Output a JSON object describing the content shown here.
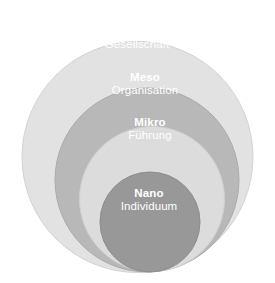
{
  "chart_data": {
    "type": "diagram",
    "subtype": "nested-concentric-circles",
    "title": "",
    "background_color": "#ffffff",
    "canvas": {
      "width": 275,
      "height": 283
    },
    "label_text_color": "#ffffff",
    "levels": [
      {
        "id": "makro",
        "title": "Makro",
        "subtitle": "Gesellschaft",
        "fill": "#e2e2e2",
        "stroke": "#d2d2d2",
        "cx": 137.5,
        "cy": 157.0,
        "r": 115.5,
        "label_x": 137,
        "label_y": 25
      },
      {
        "id": "meso",
        "title": "Meso",
        "subtitle": "Organisation",
        "fill": "#b8b8b8",
        "stroke": "#ababab",
        "cx": 147.0,
        "cy": 180.0,
        "r": 92.0,
        "label_x": 145,
        "label_y": 71
      },
      {
        "id": "mikro",
        "title": "Mikro",
        "subtitle": "Führung",
        "fill": "#dcdcdc",
        "stroke": "#cfcfcf",
        "cx": 152.0,
        "cy": 199.0,
        "r": 72.5,
        "label_x": 150,
        "label_y": 116
      },
      {
        "id": "nano",
        "title": "Nano",
        "subtitle": "Individuum",
        "fill": "#989898",
        "stroke": "#8d8d8d",
        "cx": 150.0,
        "cy": 222.0,
        "r": 50.0,
        "label_x": 149,
        "label_y": 187
      }
    ]
  }
}
